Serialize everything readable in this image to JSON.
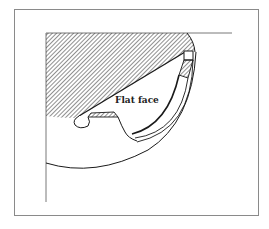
{
  "diagram": {
    "type": "mechanical-cross-section",
    "labels": {
      "flat_face": "Flat face"
    },
    "colors": {
      "line": "#1a1a1a",
      "frame": "#8a8a8a",
      "axis": "#555555",
      "hatch": "#333333",
      "background": "#ffffff"
    },
    "elements": [
      "outer-frame",
      "vertical-axis-line",
      "horizontal-axis-line",
      "hatched-section",
      "flat-face-diagonal",
      "outer-arc",
      "inner-curved-groove",
      "seal-rectangle",
      "small-round-notch",
      "hatched-lip"
    ]
  }
}
